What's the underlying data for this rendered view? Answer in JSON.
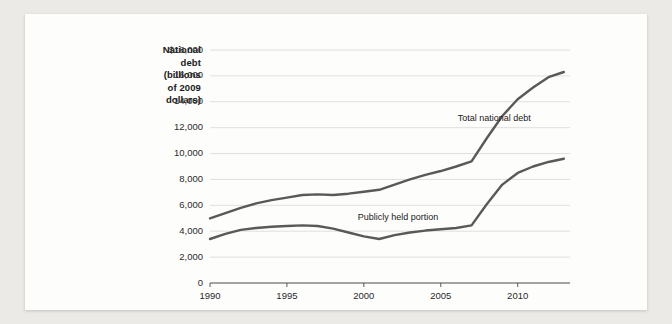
{
  "chart_data": {
    "type": "line",
    "title": "",
    "ylabel_lines": [
      "National",
      "debt",
      "(billions",
      "of 2009",
      "dollars)"
    ],
    "xlabel": "",
    "ylim": [
      0,
      18000
    ],
    "xlim": [
      1990,
      2013
    ],
    "yticks": [
      "0",
      "2,000",
      "4,000",
      "6,000",
      "8,000",
      "10,000",
      "12,000",
      "14,000",
      "16,000",
      "$18,000"
    ],
    "ytick_values": [
      0,
      2000,
      4000,
      6000,
      8000,
      10000,
      12000,
      14000,
      16000,
      18000
    ],
    "xticks": [
      "1990",
      "1995",
      "2000",
      "2005",
      "2010"
    ],
    "xtick_values": [
      1990,
      1995,
      2000,
      2005,
      2010
    ],
    "grid": "horizontal",
    "legend_position": "inline-annotations",
    "series": [
      {
        "name": "Total national debt",
        "color": "#595959",
        "x": [
          1990,
          1991,
          1992,
          1993,
          1994,
          1995,
          1996,
          1997,
          1998,
          1999,
          2000,
          2001,
          2002,
          2003,
          2004,
          2005,
          2006,
          2007,
          2008,
          2009,
          2010,
          2011,
          2012,
          2013
        ],
        "values": [
          5000,
          5400,
          5800,
          6150,
          6400,
          6600,
          6800,
          6850,
          6800,
          6900,
          7050,
          7200,
          7600,
          8000,
          8350,
          8650,
          9000,
          9400,
          11200,
          12900,
          14200,
          15100,
          15900,
          16300
        ]
      },
      {
        "name": "Publicly held portion",
        "color": "#595959",
        "x": [
          1990,
          1991,
          1992,
          1993,
          1994,
          1995,
          1996,
          1997,
          1998,
          1999,
          2000,
          2001,
          2002,
          2003,
          2004,
          2005,
          2006,
          2007,
          2008,
          2009,
          2010,
          2011,
          2012,
          2013
        ],
        "values": [
          3400,
          3800,
          4100,
          4250,
          4350,
          4400,
          4450,
          4400,
          4200,
          3900,
          3600,
          3400,
          3700,
          3900,
          4050,
          4150,
          4250,
          4450,
          6100,
          7600,
          8500,
          9000,
          9350,
          9600
        ]
      }
    ],
    "annotations": [
      {
        "text": "Total national debt",
        "x": 2006.1,
        "y": 12650
      },
      {
        "text": "Publicly held portion",
        "x": 1999.6,
        "y": 5050
      }
    ]
  }
}
